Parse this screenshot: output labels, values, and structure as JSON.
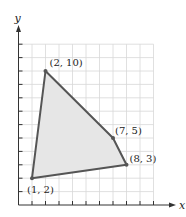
{
  "chart_data": {
    "type": "scatter",
    "title": "",
    "xlabel": "x",
    "ylabel": "y",
    "xlim": [
      0,
      10
    ],
    "ylim": [
      0,
      12
    ],
    "grid": true,
    "series": [
      {
        "name": "polygon",
        "shape": "filled-quadrilateral",
        "points": [
          {
            "x": 2,
            "y": 10,
            "label": "(2, 10)"
          },
          {
            "x": 7,
            "y": 5,
            "label": "(7, 5)"
          },
          {
            "x": 8,
            "y": 3,
            "label": "(8, 3)"
          },
          {
            "x": 1,
            "y": 2,
            "label": "(1, 2)"
          }
        ]
      }
    ]
  },
  "colors": {
    "edge": "#555555",
    "fill": "#e6e6e6",
    "grid": "#d8d8d8",
    "axis": "#333333"
  },
  "labels": {
    "p1": "(2, 10)",
    "p2": "(7, 5)",
    "p3": "(8, 3)",
    "p4": "(1, 2)",
    "x_axis": "x",
    "y_axis": "y"
  }
}
